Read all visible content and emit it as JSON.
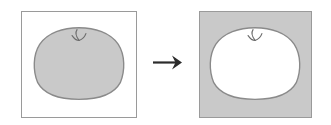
{
  "figure": {
    "caption": "",
    "type": "figure-ground-inversion-diagram"
  },
  "colors": {
    "canvas_background": "#ffffff",
    "panel_border": "#9a9a9a",
    "shape_fill_gray": "#c9c9c9",
    "shape_fill_white": "#ffffff",
    "shape_outline": "#8a8a8a",
    "stem_stroke": "#6e6e6e",
    "arrow_color": "#2b2b2b"
  },
  "panels": [
    {
      "id": "before",
      "label": "",
      "background": "#ffffff",
      "border_color": "#9a9a9a",
      "shape": {
        "name": "apple-silhouette",
        "fill": "#c9c9c9",
        "outline": "#8a8a8a",
        "stem_visible": true
      }
    },
    {
      "id": "after",
      "label": "",
      "background": "#c9c9c9",
      "border_color": "#9a9a9a",
      "shape": {
        "name": "apple-silhouette",
        "fill": "#ffffff",
        "outline": "#8a8a8a",
        "stem_visible": true
      }
    }
  ],
  "arrow": {
    "label": "",
    "direction": "right",
    "color": "#2b2b2b"
  }
}
